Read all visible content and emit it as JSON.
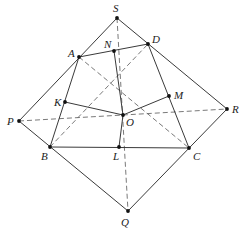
{
  "diagram": {
    "type": "geometry",
    "points": {
      "S": {
        "x": 117,
        "y": 18,
        "label": "S",
        "lx": 113,
        "ly": 12
      },
      "D": {
        "x": 148,
        "y": 44,
        "label": "D",
        "lx": 152,
        "ly": 43
      },
      "N": {
        "x": 114,
        "y": 51,
        "label": "N",
        "lx": 104,
        "ly": 48
      },
      "A": {
        "x": 79,
        "y": 57,
        "label": "A",
        "lx": 68,
        "ly": 57
      },
      "K": {
        "x": 65,
        "y": 102,
        "label": "K",
        "lx": 54,
        "ly": 106
      },
      "M": {
        "x": 169,
        "y": 96,
        "label": "M",
        "lx": 174,
        "ly": 99
      },
      "O": {
        "x": 123,
        "y": 115,
        "label": "O",
        "lx": 126,
        "ly": 126
      },
      "P": {
        "x": 19,
        "y": 121,
        "label": "P",
        "lx": 7,
        "ly": 125
      },
      "R": {
        "x": 227,
        "y": 109,
        "label": "R",
        "lx": 232,
        "ly": 113
      },
      "B": {
        "x": 50,
        "y": 147,
        "label": "B",
        "lx": 41,
        "ly": 160
      },
      "L": {
        "x": 119,
        "y": 147,
        "label": "L",
        "lx": 113,
        "ly": 160
      },
      "C": {
        "x": 189,
        "y": 148,
        "label": "C",
        "lx": 193,
        "ly": 160
      },
      "Q": {
        "x": 128,
        "y": 211,
        "label": "Q",
        "lx": 121,
        "ly": 226
      }
    },
    "solid_segments": [
      [
        "S",
        "P"
      ],
      [
        "S",
        "R"
      ],
      [
        "P",
        "Q"
      ],
      [
        "R",
        "Q"
      ],
      [
        "A",
        "D"
      ],
      [
        "A",
        "B"
      ],
      [
        "D",
        "C"
      ],
      [
        "B",
        "C"
      ],
      [
        "K",
        "O"
      ],
      [
        "M",
        "O"
      ],
      [
        "N",
        "O"
      ],
      [
        "L",
        "O"
      ]
    ],
    "dashed_segments": [
      [
        "S",
        "Q"
      ],
      [
        "P",
        "R"
      ],
      [
        "A",
        "C"
      ],
      [
        "B",
        "D"
      ]
    ]
  }
}
